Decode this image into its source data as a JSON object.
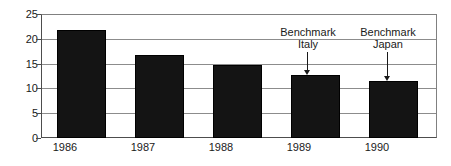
{
  "chart_data": {
    "type": "bar",
    "title": "",
    "xlabel": "",
    "ylabel": "",
    "categories": [
      "1986",
      "1987",
      "1988",
      "1989",
      "1990"
    ],
    "values": [
      21.8,
      16.7,
      14.7,
      12.7,
      11.5
    ],
    "ylim": [
      0,
      25
    ],
    "yticks": [
      0,
      5,
      10,
      15,
      20,
      25
    ],
    "ytick_labels": [
      "0",
      "5",
      "10",
      "15",
      "20",
      "25"
    ],
    "grid": true,
    "legend": "none",
    "series": [
      {
        "name": "",
        "values": [
          21.8,
          16.7,
          14.7,
          12.7,
          11.5
        ]
      }
    ],
    "bar_color": "#141414",
    "gridline_color": "#8c8c8c",
    "axis_color": "#4d4d4d",
    "text_color": "#1a1a1a",
    "annotations": [
      {
        "id": "benchmark-italy",
        "line1": "Benchmark",
        "line2": "Italy",
        "points_to_category": "1989",
        "points_to_value": 12.7
      },
      {
        "id": "benchmark-japan",
        "line1": "Benchmark",
        "line2": "Japan",
        "points_to_category": "1990",
        "points_to_value": 11.5
      }
    ]
  }
}
